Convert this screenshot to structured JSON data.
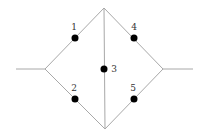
{
  "diagram": {
    "type": "bridge-network",
    "width": 205,
    "height": 135,
    "colors": {
      "edge": "#a8a8a8",
      "node": "#000000",
      "label": "#333333",
      "background": "#ffffff"
    },
    "vertices": {
      "left_terminal": [
        16,
        69
      ],
      "left": [
        45,
        69
      ],
      "top": [
        104,
        8
      ],
      "bottom": [
        105,
        129
      ],
      "right": [
        163,
        69
      ],
      "right_terminal": [
        193,
        69
      ]
    },
    "edges": [
      {
        "id": "stub-left",
        "from": "left_terminal",
        "to": "left"
      },
      {
        "id": "edge-1",
        "from": "left",
        "to": "top",
        "component": "1"
      },
      {
        "id": "edge-2",
        "from": "left",
        "to": "bottom",
        "component": "2"
      },
      {
        "id": "edge-3",
        "from": "top",
        "to": "bottom",
        "component": "3"
      },
      {
        "id": "edge-4",
        "from": "top",
        "to": "right",
        "component": "4"
      },
      {
        "id": "edge-5",
        "from": "bottom",
        "to": "right",
        "component": "5"
      },
      {
        "id": "stub-right",
        "from": "right",
        "to": "right_terminal"
      }
    ],
    "components": [
      {
        "label": "1",
        "x": 75,
        "y": 38,
        "label_x": 74,
        "label_y": 30
      },
      {
        "label": "2",
        "x": 75,
        "y": 99,
        "label_x": 74,
        "label_y": 91
      },
      {
        "label": "3",
        "x": 104,
        "y": 69,
        "label_x": 114,
        "label_y": 72
      },
      {
        "label": "4",
        "x": 134,
        "y": 38,
        "label_x": 134,
        "label_y": 30
      },
      {
        "label": "5",
        "x": 134,
        "y": 99,
        "label_x": 133,
        "label_y": 91
      }
    ]
  }
}
